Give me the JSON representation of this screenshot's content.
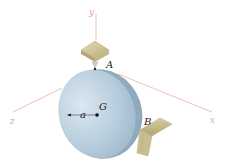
{
  "diagram": {
    "type": "3d-rigid-body-statics",
    "axes": [
      {
        "name": "y",
        "label": "y"
      },
      {
        "name": "x",
        "label": "x"
      },
      {
        "name": "z",
        "label": "z"
      }
    ],
    "points": [
      {
        "name": "A",
        "label": "A",
        "description": "support point at top of disk (pin/ball from bracket above)"
      },
      {
        "name": "B",
        "label": "B",
        "description": "support point at right edge of disk (bracket on right)"
      },
      {
        "name": "G",
        "label": "G",
        "description": "center of mass of disk"
      }
    ],
    "dimensions": [
      {
        "name": "radius",
        "label": "a",
        "description": "radius from G to disk edge"
      }
    ],
    "colors": {
      "axis": "#e8b49c",
      "disk_face": "#b8cfdf",
      "disk_edge": "#8fa9bd",
      "support": "#cfc39a",
      "support_dark": "#a99c6c",
      "text": "#222222"
    }
  }
}
